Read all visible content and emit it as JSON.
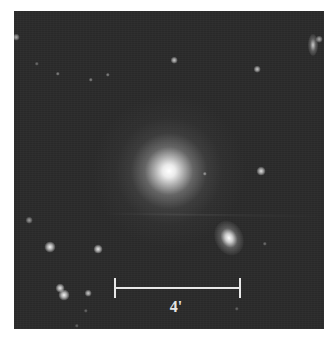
{
  "image": {
    "subject": "elliptical-galaxy-field",
    "background_color": "#2b2b2b",
    "frame_color": "#ffffff"
  },
  "scale_bar": {
    "label": "4'",
    "color": "#e8e8e8"
  },
  "objects": {
    "main_galaxy": {
      "type": "elliptical-galaxy",
      "x": 155,
      "y": 160
    },
    "companion_galaxy": {
      "type": "elliptical-galaxy",
      "x": 215,
      "y": 227
    },
    "edge_on_galaxy": {
      "type": "edge-on-galaxy",
      "x": 299,
      "y": 34
    },
    "stars": [
      {
        "x": 2,
        "y": 26,
        "size": 3,
        "brightness": 0.6
      },
      {
        "x": 160,
        "y": 49,
        "size": 3,
        "brightness": 0.75
      },
      {
        "x": 243,
        "y": 58,
        "size": 3,
        "brightness": 0.75
      },
      {
        "x": 305,
        "y": 28,
        "size": 3,
        "brightness": 0.6
      },
      {
        "x": 23,
        "y": 53,
        "size": 2,
        "brightness": 0.35
      },
      {
        "x": 44,
        "y": 63,
        "size": 2,
        "brightness": 0.45
      },
      {
        "x": 77,
        "y": 69,
        "size": 2,
        "brightness": 0.45
      },
      {
        "x": 94,
        "y": 64,
        "size": 2,
        "brightness": 0.45
      },
      {
        "x": 191,
        "y": 163,
        "size": 2,
        "brightness": 0.5
      },
      {
        "x": 247,
        "y": 160,
        "size": 4,
        "brightness": 0.85
      },
      {
        "x": 15,
        "y": 209,
        "size": 3,
        "brightness": 0.55
      },
      {
        "x": 36,
        "y": 236,
        "size": 5,
        "brightness": 0.95
      },
      {
        "x": 84,
        "y": 238,
        "size": 4,
        "brightness": 0.9
      },
      {
        "x": 46,
        "y": 277,
        "size": 4,
        "brightness": 0.9
      },
      {
        "x": 50,
        "y": 284,
        "size": 5,
        "brightness": 0.95
      },
      {
        "x": 74,
        "y": 282,
        "size": 3,
        "brightness": 0.75
      },
      {
        "x": 251,
        "y": 233,
        "size": 2,
        "brightness": 0.35
      },
      {
        "x": 223,
        "y": 298,
        "size": 2,
        "brightness": 0.3
      },
      {
        "x": 72,
        "y": 300,
        "size": 2,
        "brightness": 0.3
      },
      {
        "x": 63,
        "y": 315,
        "size": 2,
        "brightness": 0.3
      }
    ]
  }
}
